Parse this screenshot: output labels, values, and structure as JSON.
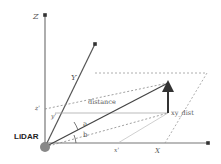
{
  "diagram": {
    "labels": {
      "z_axis": "Z",
      "y_axis": "Y",
      "x_axis": "X",
      "z_prime": "z'",
      "y_prime": "y'",
      "x_prime": "x'",
      "distance": "distance",
      "xy_dist": "xy_dist",
      "angle_a": "a",
      "angle_b": "b",
      "sensor": "LiDAR"
    },
    "colors": {
      "axis": "#777777",
      "vector": "#333333",
      "dashed": "#999999",
      "sensor_dot": "#888888"
    }
  }
}
